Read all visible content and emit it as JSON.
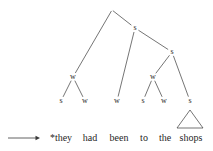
{
  "figure": {
    "type": "metrical-tree",
    "caption_arrow": "→",
    "sentence": "*they had been to the shops",
    "ungrammatical_marker": "*"
  },
  "colors": {
    "line": "#3a3a3a",
    "text": "#1f1f1f",
    "background": "#ffffff"
  },
  "tree": {
    "nodes": [
      {
        "id": "root",
        "label": "",
        "x": 112,
        "y": 10
      },
      {
        "id": "s1",
        "label": "s",
        "x": 135,
        "y": 28
      },
      {
        "id": "s2",
        "label": "s",
        "x": 172,
        "y": 52
      },
      {
        "id": "w1",
        "label": "w",
        "x": 73,
        "y": 77
      },
      {
        "id": "w2",
        "label": "w",
        "x": 153,
        "y": 77
      },
      {
        "id": "leaf1",
        "label": "s",
        "x": 61,
        "y": 101
      },
      {
        "id": "leaf2",
        "label": "w",
        "x": 85,
        "y": 101
      },
      {
        "id": "leaf3",
        "label": "w",
        "x": 117,
        "y": 101
      },
      {
        "id": "leaf4",
        "label": "s",
        "x": 143,
        "y": 101
      },
      {
        "id": "leaf5",
        "label": "w",
        "x": 164,
        "y": 101
      },
      {
        "id": "leaf6",
        "label": "s",
        "x": 190,
        "y": 101
      }
    ],
    "edges": [
      {
        "from": "root",
        "to": "w1"
      },
      {
        "from": "root",
        "to": "s1"
      },
      {
        "from": "s1",
        "to": "leaf3"
      },
      {
        "from": "s1",
        "to": "s2"
      },
      {
        "from": "s2",
        "to": "w2"
      },
      {
        "from": "s2",
        "to": "leaf6"
      },
      {
        "from": "w1",
        "to": "leaf1"
      },
      {
        "from": "w1",
        "to": "leaf2"
      },
      {
        "from": "w2",
        "to": "leaf4"
      },
      {
        "from": "w2",
        "to": "leaf5"
      }
    ],
    "triangle": {
      "apex_x": 190,
      "apex_y": 110,
      "left_x": 177,
      "left_y": 128,
      "right_x": 203,
      "right_y": 128
    }
  },
  "arrow": {
    "label": "derivation-arrow",
    "x1": 8,
    "y1": 138,
    "x2": 40,
    "y2": 138
  },
  "words": [
    {
      "text": "*they",
      "x": 61,
      "y": 132
    },
    {
      "text": "had",
      "x": 90,
      "y": 132
    },
    {
      "text": "been",
      "x": 119,
      "y": 132
    },
    {
      "text": "to",
      "x": 144,
      "y": 132
    },
    {
      "text": "the",
      "x": 165,
      "y": 132
    },
    {
      "text": "shops",
      "x": 191,
      "y": 132
    }
  ]
}
